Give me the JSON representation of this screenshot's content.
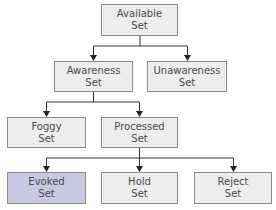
{
  "diagram": {
    "type": "tree",
    "colors": {
      "box_fill": "#ededed",
      "box_border": "#8a8a8a",
      "highlight_fill": "#c9c8e2",
      "line": "#333333"
    },
    "nodes": {
      "available": {
        "line1": "Available",
        "line2": "Set"
      },
      "awareness": {
        "line1": "Awareness",
        "line2": "Set"
      },
      "unawareness": {
        "line1": "Unawareness",
        "line2": "Set"
      },
      "foggy": {
        "line1": "Foggy",
        "line2": "Set"
      },
      "processed": {
        "line1": "Processed",
        "line2": "Set"
      },
      "evoked": {
        "line1": "Evoked",
        "line2": "Set"
      },
      "hold": {
        "line1": "Hold",
        "line2": "Set"
      },
      "reject": {
        "line1": "Reject",
        "line2": "Set"
      }
    },
    "edges": [
      [
        "available",
        "awareness"
      ],
      [
        "available",
        "unawareness"
      ],
      [
        "awareness",
        "foggy"
      ],
      [
        "awareness",
        "processed"
      ],
      [
        "processed",
        "evoked"
      ],
      [
        "processed",
        "hold"
      ],
      [
        "processed",
        "reject"
      ]
    ]
  }
}
